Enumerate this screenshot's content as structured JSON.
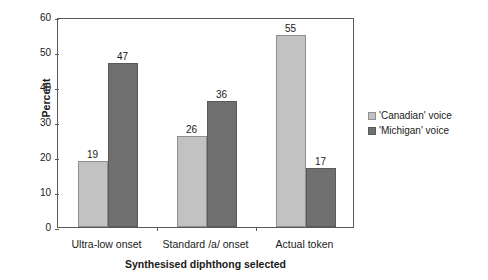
{
  "chart_data": {
    "type": "bar",
    "title": "",
    "xlabel": "Synthesised diphthong selected",
    "ylabel": "Percent",
    "categories": [
      "Ultra-low onset",
      "Standard /a/ onset",
      "Actual token"
    ],
    "series": [
      {
        "name": "'Canadian' voice",
        "color": "#c2c2c2",
        "values": [
          19,
          26,
          55
        ]
      },
      {
        "name": "'Michigan' voice",
        "color": "#6f6f6f",
        "values": [
          47,
          36,
          17
        ]
      }
    ],
    "ylim": [
      0,
      60
    ],
    "yticks": [
      0,
      10,
      20,
      30,
      40,
      50,
      60
    ],
    "ytick_labels": [
      "0",
      "10",
      "20",
      "30",
      "40",
      "50",
      "60"
    ],
    "grid": false,
    "legend_position": "right",
    "data_labels": true
  },
  "axes": {
    "y_title": "Percent",
    "x_title": "Synthesised diphthong selected"
  },
  "legend": {
    "items": [
      {
        "label": "'Canadian' voice"
      },
      {
        "label": "'Michigan' voice"
      }
    ]
  }
}
